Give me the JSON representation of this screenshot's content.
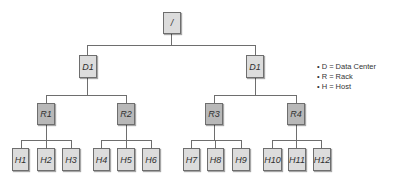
{
  "diagram": {
    "root": {
      "label": "/"
    },
    "datacenters": [
      {
        "label": "D1"
      },
      {
        "label": "D1"
      }
    ],
    "racks": [
      {
        "label": "R1"
      },
      {
        "label": "R2"
      },
      {
        "label": "R3"
      },
      {
        "label": "R4"
      }
    ],
    "hosts": [
      {
        "label": "H1"
      },
      {
        "label": "H2"
      },
      {
        "label": "H3"
      },
      {
        "label": "H4"
      },
      {
        "label": "H5"
      },
      {
        "label": "H6"
      },
      {
        "label": "H7"
      },
      {
        "label": "H8"
      },
      {
        "label": "H9"
      },
      {
        "label": "H10"
      },
      {
        "label": "H11"
      },
      {
        "label": "H12"
      }
    ],
    "edges": [
      [
        "/",
        "D1 (left)"
      ],
      [
        "/",
        "D1 (right)"
      ],
      [
        "D1 (left)",
        "R1"
      ],
      [
        "D1 (left)",
        "R2"
      ],
      [
        "D1 (right)",
        "R3"
      ],
      [
        "D1 (right)",
        "R4"
      ],
      [
        "R1",
        "H1"
      ],
      [
        "R1",
        "H2"
      ],
      [
        "R1",
        "H3"
      ],
      [
        "R2",
        "H4"
      ],
      [
        "R2",
        "H5"
      ],
      [
        "R2",
        "H6"
      ],
      [
        "R3",
        "H7"
      ],
      [
        "R3",
        "H8"
      ],
      [
        "R3",
        "H9"
      ],
      [
        "R4",
        "H10"
      ],
      [
        "R4",
        "H11"
      ],
      [
        "R4",
        "H12"
      ]
    ]
  },
  "legend": {
    "bullet": "•",
    "items": [
      {
        "text": "D = Data Center"
      },
      {
        "text": "R = Rack"
      },
      {
        "text": "H = Host"
      }
    ]
  },
  "colors": {
    "line": "#6e6e6e",
    "light_node": "#dcdcdc",
    "rack_node": "#b8b8b8"
  }
}
